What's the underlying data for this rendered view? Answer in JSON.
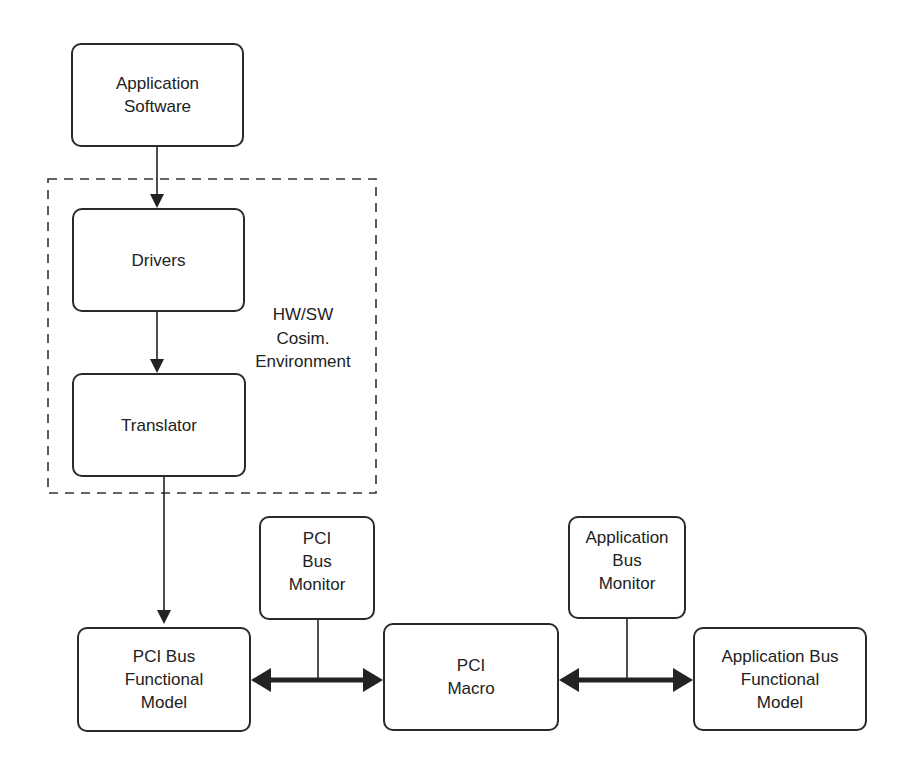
{
  "diagram": {
    "title": "",
    "nodes": {
      "app_software": "Application\nSoftware",
      "drivers": "Drivers",
      "translator": "Translator",
      "pci_bus_monitor": "PCI\nBus\nMonitor",
      "app_bus_monitor": "Application\nBus\nMonitor",
      "pci_bfm": "PCI Bus\nFunctional\nModel",
      "pci_macro": "PCI\nMacro",
      "app_bfm": "Application Bus\nFunctional\nModel"
    },
    "group_label": "HW/SW\nCosim.\nEnvironment",
    "edges": [
      {
        "from": "Application Software",
        "to": "Drivers",
        "type": "arrow"
      },
      {
        "from": "Drivers",
        "to": "Translator",
        "type": "arrow"
      },
      {
        "from": "Translator",
        "to": "PCI Bus Functional Model",
        "type": "arrow"
      },
      {
        "from": "PCI Bus Functional Model",
        "to": "PCI Macro",
        "type": "bidirectional-bus",
        "monitor": "PCI Bus Monitor"
      },
      {
        "from": "PCI Macro",
        "to": "Application Bus Functional Model",
        "type": "bidirectional-bus",
        "monitor": "Application Bus Monitor"
      }
    ],
    "colors": {
      "stroke": "#2a2a2a",
      "background": "#ffffff"
    }
  }
}
